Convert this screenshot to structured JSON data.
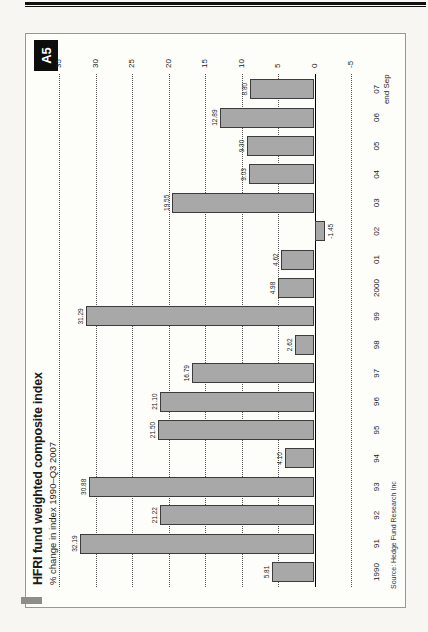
{
  "figure": {
    "badge": "A5",
    "title": "HFRI fund weighted composite index",
    "subtitle": "% change in index 1990–Q3 2007",
    "source": "Source: Hedge Fund Research Inc"
  },
  "chart_data": {
    "type": "bar",
    "title": "HFRI fund weighted composite index",
    "subtitle": "% change in index 1990–Q3 2007",
    "xlabel": "",
    "ylabel": "% change in index",
    "categories": [
      "1990",
      "91",
      "92",
      "93",
      "94",
      "95",
      "96",
      "97",
      "98",
      "99",
      "2000",
      "01",
      "02",
      "03",
      "04",
      "05",
      "06",
      "07"
    ],
    "last_category_note": "end Sep",
    "values": [
      5.81,
      32.19,
      21.22,
      30.88,
      4.1,
      21.5,
      21.1,
      16.79,
      2.62,
      31.29,
      4.98,
      4.62,
      -1.45,
      19.55,
      9.03,
      9.3,
      12.89,
      8.8
    ],
    "bar_labels": [
      "5.81",
      "32.19",
      "21.22",
      "30.88",
      "4.10",
      "21.50",
      "21.10",
      "16.79",
      "2.62",
      "31.29",
      "4.98",
      "4.62",
      "-1.45",
      "19.55",
      "9.03",
      "9.30",
      "12.89",
      "8.80"
    ],
    "ylim": [
      -5,
      35
    ],
    "yticks": [
      35,
      30,
      25,
      20,
      15,
      10,
      5,
      0,
      -5
    ],
    "grid": "horizontal dotted gridlines, solid line at zero",
    "legend_position": "none",
    "ticks_side": "right",
    "orientation_on_page": "figure rotated 90deg counter-clockwise",
    "bar_color": "#a8a8a8",
    "bar_border_color": "#3c3c3c",
    "badge_color": "#0d0d0d"
  }
}
